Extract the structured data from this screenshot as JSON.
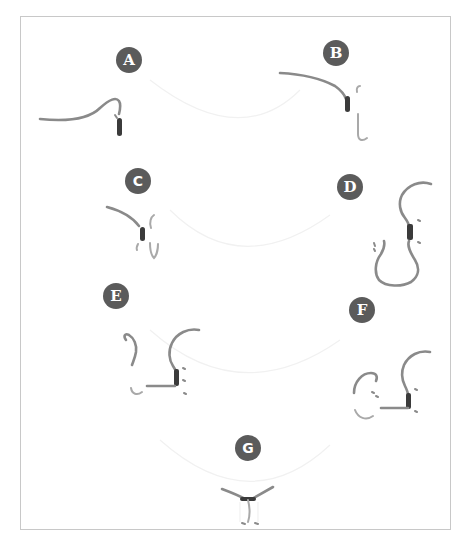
{
  "diagram": {
    "type": "step-by-step illustration",
    "colors": {
      "badge_fill": "#5b5b5b",
      "badge_text": "#ffffff",
      "cord": "#8a8a8a",
      "wrap": "#3b3b3b",
      "frame_border": "#c8c8c8",
      "background": "#ffffff"
    },
    "steps": [
      {
        "label": "A"
      },
      {
        "label": "B"
      },
      {
        "label": "C"
      },
      {
        "label": "D"
      },
      {
        "label": "E"
      },
      {
        "label": "F"
      },
      {
        "label": "G"
      }
    ]
  }
}
